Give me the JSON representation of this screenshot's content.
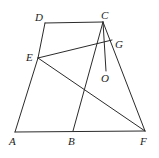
{
  "figure": {
    "type": "geometry-diagram",
    "stroke_color": "#2b2b2b",
    "background_color": "#ffffff",
    "points": {
      "A": {
        "label": "A",
        "x": 15,
        "y": 132,
        "label_x": 9,
        "label_y": 136
      },
      "B": {
        "label": "B",
        "x": 73,
        "y": 131,
        "label_x": 68,
        "label_y": 136
      },
      "F": {
        "label": "F",
        "x": 145,
        "y": 131,
        "label_x": 140,
        "label_y": 136
      },
      "D": {
        "label": "D",
        "x": 45,
        "y": 23,
        "label_x": 35,
        "label_y": 12
      },
      "C": {
        "label": "C",
        "x": 103,
        "y": 22,
        "label_x": 101,
        "label_y": 10
      },
      "E": {
        "label": "E",
        "x": 38,
        "y": 58,
        "label_x": 26,
        "label_y": 52
      },
      "G": {
        "label": "G",
        "x": 112,
        "y": 40,
        "label_x": 115,
        "label_y": 39
      },
      "O": {
        "label": "O",
        "x": 106,
        "y": 71,
        "label_x": 101,
        "label_y": 73
      }
    },
    "segments": [
      {
        "name": "segment-D-C",
        "from": "D",
        "to": "C"
      },
      {
        "name": "segment-D-E",
        "from": "D",
        "to": "E"
      },
      {
        "name": "segment-E-A",
        "from": "E",
        "to": "A"
      },
      {
        "name": "segment-A-F",
        "from": "A",
        "to": "F"
      },
      {
        "name": "segment-C-F",
        "from": "C",
        "to": "F"
      },
      {
        "name": "segment-C-B",
        "from": "C",
        "to": "B"
      },
      {
        "name": "segment-C-O",
        "from": "C",
        "to": "O"
      },
      {
        "name": "segment-E-G",
        "from": "E",
        "to": "G"
      },
      {
        "name": "segment-E-F",
        "from": "E",
        "to": "F"
      }
    ]
  }
}
